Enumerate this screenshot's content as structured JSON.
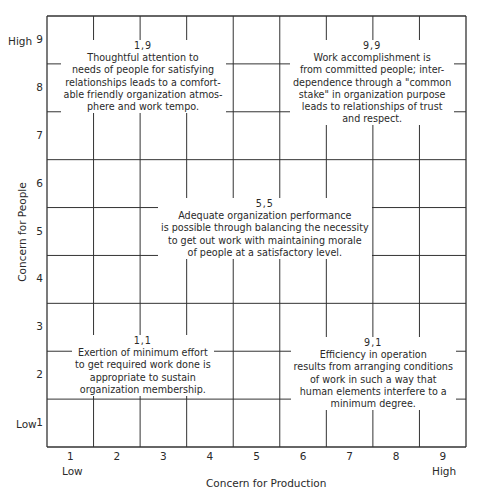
{
  "y_axis": {
    "label": "Concern for People",
    "low_label": "Low",
    "high_label": "High",
    "ticks": [
      "1",
      "2",
      "3",
      "4",
      "5",
      "6",
      "7",
      "8",
      "9"
    ]
  },
  "x_axis": {
    "label": "Concern for Production",
    "low_label": "Low",
    "high_label": "High",
    "ticks": [
      "1",
      "2",
      "3",
      "4",
      "5",
      "6",
      "7",
      "8",
      "9"
    ]
  },
  "styles": [
    {
      "coord": "1,9",
      "lines": [
        "Thoughtful attention to",
        "needs of people for satisfying",
        "relationships leads to a comfort-",
        "able friendly organization atmos-",
        "phere and work tempo."
      ]
    },
    {
      "coord": "9,9",
      "lines": [
        "Work accomplishment is",
        "from committed people; inter-",
        "dependence through a \"common",
        "stake\" in organization purpose",
        "leads to relationships of trust",
        "and respect."
      ]
    },
    {
      "coord": "5,5",
      "lines": [
        "Adequate organization performance",
        "is possible through balancing the necessity",
        "to get out work with maintaining morale",
        "of people at a satisfactory level."
      ]
    },
    {
      "coord": "1,1",
      "lines": [
        "Exertion of minimum effort",
        "to get required work done is",
        "appropriate to sustain",
        "organization membership."
      ]
    },
    {
      "coord": "9,1",
      "lines": [
        "Efficiency in operation",
        "results from arranging conditions",
        "of work in such a way that",
        "human elements interfere to a",
        "minimum degree."
      ]
    }
  ]
}
